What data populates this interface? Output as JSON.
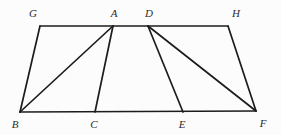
{
  "figure": {
    "background": "#fcfcfc",
    "stroke_color": "#1c1c1c",
    "stroke_width": 1.7,
    "label_color": "#2b2b2b",
    "label_font_size": 11,
    "width": 281,
    "height": 135,
    "points": [
      {
        "id": "G",
        "x": 40,
        "y": 26,
        "label": "G",
        "label_x": 33,
        "label_y": 17
      },
      {
        "id": "A",
        "x": 113,
        "y": 26,
        "label": "A",
        "label_x": 114,
        "label_y": 17
      },
      {
        "id": "D",
        "x": 148,
        "y": 26,
        "label": "D",
        "label_x": 149,
        "label_y": 17
      },
      {
        "id": "H",
        "x": 228,
        "y": 26,
        "label": "H",
        "label_x": 236,
        "label_y": 17
      },
      {
        "id": "B",
        "x": 20,
        "y": 112,
        "label": "B",
        "label_x": 15,
        "label_y": 128
      },
      {
        "id": "C",
        "x": 95,
        "y": 112,
        "label": "C",
        "label_x": 94,
        "label_y": 128
      },
      {
        "id": "E",
        "x": 183,
        "y": 112,
        "label": "E",
        "label_x": 182,
        "label_y": 128
      },
      {
        "id": "F",
        "x": 256,
        "y": 111,
        "label": "F",
        "label_x": 263,
        "label_y": 127
      }
    ],
    "edges": [
      {
        "from": "G",
        "to": "H"
      },
      {
        "from": "B",
        "to": "F"
      },
      {
        "from": "G",
        "to": "B"
      },
      {
        "from": "H",
        "to": "F"
      },
      {
        "from": "A",
        "to": "B"
      },
      {
        "from": "A",
        "to": "C"
      },
      {
        "from": "D",
        "to": "E"
      },
      {
        "from": "D",
        "to": "F"
      }
    ]
  }
}
